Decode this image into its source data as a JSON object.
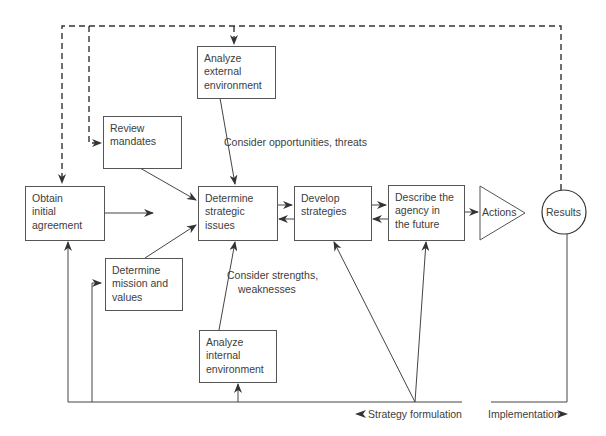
{
  "diagram": {
    "nodes": {
      "obtain_agreement": {
        "lines": [
          "Obtain",
          "initial",
          "agreement"
        ]
      },
      "review_mandates": {
        "lines": [
          "Review",
          "mandates"
        ]
      },
      "determine_mission": {
        "lines": [
          "Determine",
          "mission and",
          "values"
        ]
      },
      "analyze_external": {
        "lines": [
          "Analyze",
          "external",
          "environment"
        ]
      },
      "analyze_internal": {
        "lines": [
          "Analyze",
          "internal",
          "environment"
        ]
      },
      "determine_issues": {
        "lines": [
          "Determine",
          "strategic",
          "issues"
        ]
      },
      "develop_strategies": {
        "lines": [
          "Develop",
          "strategies"
        ]
      },
      "describe_future": {
        "lines": [
          "Describe the",
          "agency in",
          "the future"
        ]
      },
      "actions": {
        "label": "Actions"
      },
      "results": {
        "label": "Results"
      }
    },
    "annotations": {
      "opportunities": "Consider opportunities, threats",
      "strengths_line1": "Consider strengths,",
      "strengths_line2": "weaknesses",
      "strategy_formulation": "Strategy formulation",
      "implementation": "Implementation"
    },
    "colors": {
      "line": "#444444",
      "text": "#3d3d3d",
      "background": "#ffffff"
    }
  }
}
